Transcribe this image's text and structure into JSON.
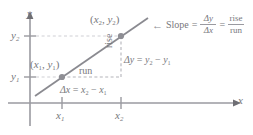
{
  "figure": {
    "axes": {
      "x_label": "x",
      "y_label": "y",
      "x_ticks": [
        "x1",
        "x2"
      ],
      "y_ticks": [
        "y1",
        "y2"
      ],
      "axis_color": "#9a9aa0"
    },
    "tick_labels": {
      "x1": "x",
      "x1_sub": "1",
      "x2": "x",
      "x2_sub": "2",
      "y1": "y",
      "y1_sub": "1",
      "y2": "y",
      "y2_sub": "2"
    },
    "points": [
      {
        "name": "point-1",
        "label_open": "(",
        "label_x": "x",
        "label_x_sub": "1",
        "label_sep": ", ",
        "label_y": "y",
        "label_y_sub": "1",
        "label_close": ")",
        "x_px": 62,
        "y_px": 77,
        "color": "#8e8e94"
      },
      {
        "name": "point-2",
        "label_open": "(",
        "label_x": "x",
        "label_x_sub": "2",
        "label_sep": ", ",
        "label_y": "y",
        "label_y_sub": "2",
        "label_close": ")",
        "x_px": 121,
        "y_px": 36,
        "color": "#8e8e94"
      }
    ],
    "annotations": {
      "run_label": "run",
      "rise_label": "rise",
      "delta_y_equation": {
        "lhs": "Δy",
        "eq": "=",
        "rhs_y2": "y",
        "rhs_y2_sub": "2",
        "minus": "−",
        "rhs_y1": "y",
        "rhs_y1_sub": "1"
      },
      "delta_x_equation": {
        "lhs": "Δx",
        "eq": "=",
        "rhs_x2": "x",
        "rhs_x2_sub": "2",
        "minus": "−",
        "rhs_x1": "x",
        "rhs_x1_sub": "1"
      }
    },
    "slope_formula": {
      "pointer": "←",
      "term": "Slope",
      "eq1": "=",
      "frac1_num": "Δy",
      "frac1_den": "Δx",
      "eq2": "=",
      "frac2_num": "rise",
      "frac2_den": "run"
    },
    "colors": {
      "line": "#8a8a90",
      "dashed": "#b4b4ba",
      "text": "#77777c",
      "background": "#ffffff"
    }
  }
}
